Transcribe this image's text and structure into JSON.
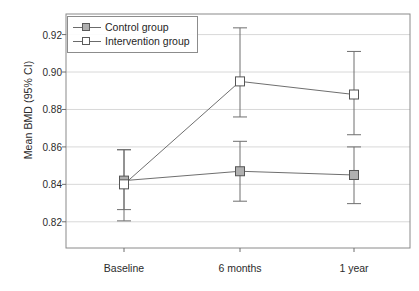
{
  "chart_data": {
    "type": "line",
    "title": "",
    "xlabel": "",
    "ylabel": "Mean BMD (95% CI)",
    "categories": [
      "Baseline",
      "6 months",
      "1 year"
    ],
    "ylim": [
      0.806,
      0.931
    ],
    "yticks": [
      0.82,
      0.84,
      0.86,
      0.88,
      0.9,
      0.92
    ],
    "ytick_labels": [
      "0.82",
      "0.84",
      "0.86",
      "0.88",
      "0.90",
      "0.92"
    ],
    "grid": true,
    "grid_axis": "y",
    "legend_position": "upper left",
    "error_bars": "95% CI",
    "series": [
      {
        "name": "Control group",
        "marker": "filled-square",
        "color": "#b0b0b0",
        "values": [
          0.842,
          0.847,
          0.845
        ],
        "ci_low": [
          0.8265,
          0.831,
          0.8297
        ],
        "ci_high": [
          0.8585,
          0.863,
          0.86
        ]
      },
      {
        "name": "Intervention group",
        "marker": "open-square",
        "color": "#ffffff",
        "values": [
          0.84,
          0.895,
          0.888
        ],
        "ci_low": [
          0.8205,
          0.876,
          0.8665
        ],
        "ci_high": [
          0.8585,
          0.9236,
          0.911
        ]
      }
    ]
  },
  "legend": {
    "items": [
      {
        "label": "Control group",
        "marker": "filled-square"
      },
      {
        "label": "Intervention group",
        "marker": "open-square"
      }
    ]
  },
  "axes": {
    "y_label": "Mean BMD (95% CI)",
    "y_tick_labels": [
      "0.92",
      "0.90",
      "0.88",
      "0.86",
      "0.84",
      "0.82"
    ],
    "x_tick_labels": [
      "Baseline",
      "6 months",
      "1 year"
    ]
  }
}
